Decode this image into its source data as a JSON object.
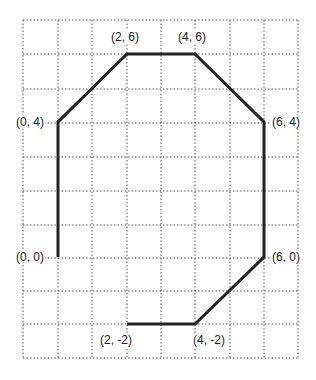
{
  "diagram": {
    "type": "polygon-on-grid",
    "grid": {
      "x_lines": [
        23,
        58,
        92,
        127,
        161,
        195,
        230,
        264,
        298
      ],
      "y_lines": [
        20,
        54,
        89,
        123,
        157,
        191,
        225,
        258,
        291,
        324,
        358
      ],
      "style": "dotted",
      "color": "#555555"
    },
    "polygon": {
      "stroke": "#222222",
      "points_labels": [
        "(0, 0)",
        "(0, 4)",
        "(2, 6)",
        "(4, 6)",
        "(6, 4)",
        "(6, 0)",
        "(4, -2)",
        "(2, -2)"
      ],
      "open_segment": "between (2, -2) and (0, 0)"
    },
    "labels": {
      "p00": "(0, 0)",
      "p04": "(0, 4)",
      "p26": "(2, 6)",
      "p46": "(4, 6)",
      "p64": "(6, 4)",
      "p60": "(6, 0)",
      "p4m2": "(4, -2)",
      "p2m2": "(2, -2)"
    }
  }
}
